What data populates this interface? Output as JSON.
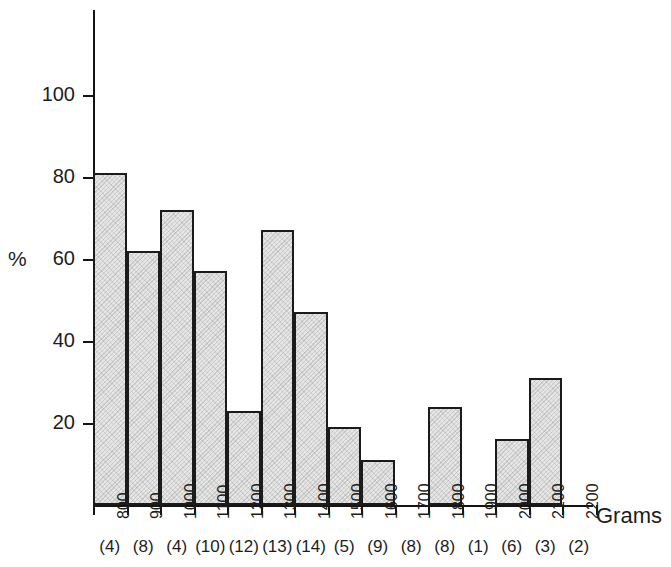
{
  "chart_data": {
    "type": "bar",
    "title": "",
    "subtitle": "",
    "xlabel": "Grams",
    "ylabel": "%",
    "categories": [
      "800",
      "900",
      "1000",
      "1100",
      "1200",
      "1300",
      "1400",
      "1500",
      "1600",
      "1700",
      "1800",
      "1900",
      "2000",
      "2100",
      "2200"
    ],
    "values": [
      81,
      62,
      72,
      57,
      23,
      67,
      47,
      19,
      11,
      0,
      24,
      0,
      16,
      31,
      0
    ],
    "counts": [
      "(4)",
      "(8)",
      "(4)",
      "(10)",
      "(12)",
      "(13)",
      "(14)",
      "(5)",
      "(9)",
      "(8)",
      "(8)",
      "(1)",
      "(6)",
      "(3)",
      "(2)"
    ],
    "ylim": [
      0,
      118
    ],
    "yticks": [
      20,
      40,
      60,
      80,
      100
    ],
    "ytick_labels": [
      "20",
      "40",
      "60",
      "80",
      "100"
    ],
    "grid": false,
    "legend": null,
    "bar_fill_color": "#e6e6e6",
    "bar_edge_color": "#1b1b1b",
    "axis_color": "#141414",
    "text_color": "#1d1d1d",
    "background_color": "#ffffff"
  },
  "axis": {
    "y_title": "%",
    "x_title": "Grams"
  }
}
